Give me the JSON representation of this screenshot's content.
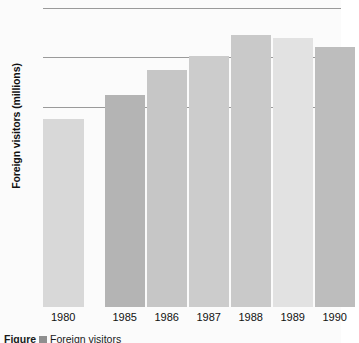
{
  "chart_data": {
    "type": "bar",
    "title": "",
    "xlabel": "",
    "ylabel": "Foreign visitors (millions)",
    "categories": [
      "1980",
      "1985",
      "1986",
      "1987",
      "1988",
      "1989",
      "1990"
    ],
    "values": [
      37.8,
      42.6,
      47.6,
      50.3,
      54.6,
      54.0,
      52.2
    ],
    "ylim": [
      0,
      60
    ],
    "yticks": [
      0,
      10,
      20,
      30,
      40,
      50,
      60
    ],
    "ytick_labels": [
      "0",
      "10",
      "20",
      "30",
      "40",
      "50",
      "60"
    ],
    "gridlines_at": [
      40,
      50,
      60
    ],
    "grid": true,
    "legend": "none",
    "bar_colors": [
      "#d8d8d8",
      "#b4b4b4",
      "#c6c6c6",
      "#cccccc",
      "#c9c9c9",
      "#e2e2e2",
      "#bdbdbd"
    ],
    "gap_after_first_category": true
  },
  "axes": {
    "y_title": "Foreign visitors (millions)",
    "y_tick_labels": [
      "60",
      "50",
      "40",
      "30",
      "20",
      "10",
      "0"
    ],
    "x_tick_labels": [
      "1980",
      "1985",
      "1986",
      "1987",
      "1988",
      "1989",
      "1990"
    ]
  },
  "caption": {
    "figure_label": "Figure",
    "text": "Foreign visitors"
  },
  "colors": {
    "background": "#fbfbfb",
    "gridline": "#9a9a9a",
    "tick": "#777777",
    "text": "#111111"
  }
}
